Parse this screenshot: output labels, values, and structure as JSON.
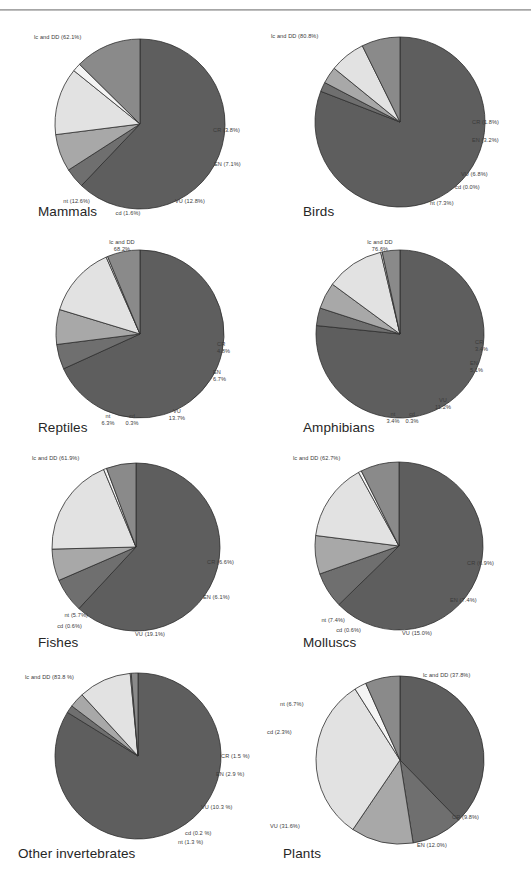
{
  "figure": {
    "background": "#ffffff",
    "rule_color": "#9a9a9a"
  },
  "palette": {
    "lc_and_DD": "#5e5e5e",
    "CR": "#6f6f6f",
    "EN": "#a8a8a8",
    "VU": "#e2e2e2",
    "cd": "#f4f4f4",
    "nt": "#8a8a8a",
    "outline": "#2f2f2f"
  },
  "chart_data": [
    {
      "type": "pie",
      "title": "Mammals",
      "labels": [
        "lc and DD",
        "CR",
        "EN",
        "VU",
        "cd",
        "nt"
      ],
      "values": [
        62.1,
        3.8,
        7.1,
        12.8,
        1.6,
        12.6
      ],
      "label_texts": [
        "lc and DD (62.1%)",
        "CR (3.8%)",
        "EN (7.1%)",
        "VU (12.8%)",
        "cd (1.6%)",
        "nt (12.6%)"
      ],
      "legend": "none",
      "grid": false
    },
    {
      "type": "pie",
      "title": "Birds",
      "labels": [
        "lc and DD",
        "CR",
        "EN",
        "VU",
        "cd",
        "nt"
      ],
      "values": [
        80.8,
        1.8,
        3.2,
        6.8,
        0.0,
        7.3
      ],
      "label_texts": [
        "lc and DD (80.8%)",
        "CR (1.8%)",
        "EN (3.2%)",
        "VU (6.8%)",
        "cd (0.0%)",
        "nt (7.3%)"
      ],
      "legend": "none",
      "grid": false
    },
    {
      "type": "pie",
      "title": "Reptiles",
      "labels": [
        "lc and DD",
        "CR",
        "EN",
        "VU",
        "cd",
        "nt"
      ],
      "values": [
        68.2,
        4.8,
        6.7,
        13.7,
        0.3,
        6.3
      ],
      "label_texts": [
        "lc and DD\n68.2%",
        "CR\n4.8%",
        "EN\n6.7%",
        "VU\n13.7%",
        "cd\n0.3%",
        "nt\n6.3%"
      ],
      "legend": "none",
      "grid": false
    },
    {
      "type": "pie",
      "title": "Amphibians",
      "labels": [
        "lc and DD",
        "CR",
        "EN",
        "VU",
        "cd",
        "nt"
      ],
      "values": [
        76.6,
        3.4,
        5.1,
        11.2,
        0.3,
        3.4
      ],
      "label_texts": [
        "lc and DD\n76.6%",
        "CR\n3.4%",
        "EN\n5.1%",
        "VU\n11.2%",
        "cd\n0.3%",
        "nt\n3.4%"
      ],
      "legend": "none",
      "grid": false
    },
    {
      "type": "pie",
      "title": "Fishes",
      "labels": [
        "lc and DD",
        "CR",
        "EN",
        "VU",
        "cd",
        "nt"
      ],
      "values": [
        61.9,
        6.6,
        6.1,
        19.1,
        0.6,
        5.7
      ],
      "label_texts": [
        "lc and DD (61.9%)",
        "CR (6.6%)",
        "EN (6.1%)",
        "VU (19.1%)",
        "cd (0.6%)",
        "nt (5.7%)"
      ],
      "legend": "none",
      "grid": false
    },
    {
      "type": "pie",
      "title": "Molluscs",
      "labels": [
        "lc and DD",
        "CR",
        "EN",
        "VU",
        "cd",
        "nt"
      ],
      "values": [
        62.7,
        6.9,
        7.4,
        15.0,
        0.6,
        7.4
      ],
      "label_texts": [
        "lc and DD (62.7%)",
        "CR (6.9%)",
        "EN (7.4%)",
        "VU (15.0%)",
        "cd (0.6%)",
        "nt (7.4%)"
      ],
      "legend": "none",
      "grid": false
    },
    {
      "type": "pie",
      "title": "Other invertebrates",
      "labels": [
        "lc and DD",
        "CR",
        "EN",
        "VU",
        "cd",
        "nt"
      ],
      "values": [
        83.8,
        1.5,
        2.9,
        10.3,
        0.2,
        1.3
      ],
      "label_texts": [
        "lc and DD (83.8 %)",
        "CR (1.5 %)",
        "EN (2.9 %)",
        "VU (10.3 %)",
        "cd (0.2 %)",
        "nt (1.3 %)"
      ],
      "legend": "none",
      "grid": false
    },
    {
      "type": "pie",
      "title": "Plants",
      "labels": [
        "lc and DD",
        "CR",
        "EN",
        "VU",
        "cd",
        "nt"
      ],
      "values": [
        37.8,
        9.8,
        12.0,
        31.6,
        2.3,
        6.7
      ],
      "label_texts": [
        "lc and DD (37.8%)",
        "CR (9.8%)",
        "EN (12.0%)",
        "VU (31.6%)",
        "cd (2.3%)",
        "nt (6.7%)"
      ],
      "legend": "none",
      "grid": false
    }
  ]
}
